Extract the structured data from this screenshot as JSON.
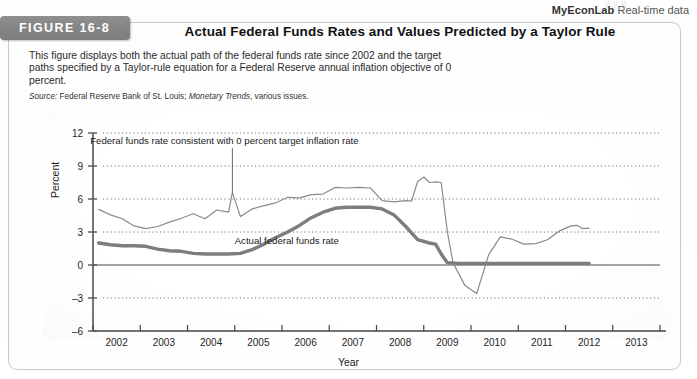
{
  "header": {
    "brand_bold": "MyEconLab",
    "brand_rest": " Real-time data",
    "bleed_text": "y  y   g"
  },
  "figure": {
    "badge_label": "FIGURE 16-8",
    "title": "Actual Federal Funds Rates and Values Predicted by a Taylor Rule",
    "description": "This figure displays both the actual path of the federal funds rate since 2002 and the target paths specified by a Taylor-rule equation for a Federal Reserve annual inflation objective of 0 percent.",
    "source_prefix": "Source:",
    "source_text": " Federal Reserve Bank of St. Louis; ",
    "source_italic": "Monetary Trends",
    "source_suffix": ", various issues."
  },
  "chart_data": {
    "type": "line",
    "title": "Actual Federal Funds Rates and Values Predicted by a Taylor Rule",
    "xlabel": "Year",
    "ylabel": "Percent",
    "xlim": [
      2001.5,
      2013.5
    ],
    "ylim": [
      -6,
      12
    ],
    "yticks": [
      12,
      9,
      6,
      3,
      0,
      -3,
      -6
    ],
    "xticks": [
      2002,
      2003,
      2004,
      2005,
      2006,
      2007,
      2008,
      2009,
      2010,
      2011,
      2012,
      2013
    ],
    "grid": "horizontal-dotted",
    "legend": "annotations",
    "annotations": [
      {
        "text": "Federal funds rate consistent with 0 percent target inflation rate",
        "target_x": 2004.45,
        "target_y": 6.6
      },
      {
        "text": "Actual federal funds rate",
        "target_x": 2005.6,
        "target_y": 2.2
      }
    ],
    "series": [
      {
        "name": "Federal funds rate consistent with 0 percent target inflation rate",
        "style": "thin",
        "color": "#8a8a8a",
        "width": 1.2,
        "points": [
          [
            2001.62,
            5.05
          ],
          [
            2001.87,
            4.55
          ],
          [
            2002.12,
            4.2
          ],
          [
            2002.37,
            3.55
          ],
          [
            2002.62,
            3.3
          ],
          [
            2002.87,
            3.5
          ],
          [
            2003.12,
            3.9
          ],
          [
            2003.37,
            4.25
          ],
          [
            2003.62,
            4.65
          ],
          [
            2003.87,
            4.2
          ],
          [
            2004.12,
            5.0
          ],
          [
            2004.37,
            4.8
          ],
          [
            2004.45,
            6.6
          ],
          [
            2004.62,
            4.4
          ],
          [
            2004.87,
            5.1
          ],
          [
            2005.12,
            5.4
          ],
          [
            2005.37,
            5.65
          ],
          [
            2005.62,
            6.15
          ],
          [
            2005.87,
            6.1
          ],
          [
            2006.12,
            6.4
          ],
          [
            2006.37,
            6.45
          ],
          [
            2006.62,
            7.05
          ],
          [
            2006.87,
            7.0
          ],
          [
            2007.12,
            7.05
          ],
          [
            2007.37,
            7.0
          ],
          [
            2007.62,
            5.85
          ],
          [
            2007.87,
            5.75
          ],
          [
            2008.12,
            5.85
          ],
          [
            2008.24,
            5.8
          ],
          [
            2008.37,
            7.6
          ],
          [
            2008.5,
            8.0
          ],
          [
            2008.62,
            7.5
          ],
          [
            2008.75,
            7.55
          ],
          [
            2008.87,
            7.5
          ],
          [
            2009.0,
            3.0
          ],
          [
            2009.12,
            0.2
          ],
          [
            2009.37,
            -1.85
          ],
          [
            2009.62,
            -2.6
          ],
          [
            2009.87,
            0.9
          ],
          [
            2010.12,
            2.55
          ],
          [
            2010.37,
            2.35
          ],
          [
            2010.62,
            1.9
          ],
          [
            2010.87,
            1.95
          ],
          [
            2011.12,
            2.3
          ],
          [
            2011.37,
            3.1
          ],
          [
            2011.62,
            3.55
          ],
          [
            2011.75,
            3.6
          ],
          [
            2011.87,
            3.3
          ],
          [
            2012.0,
            3.35
          ]
        ]
      },
      {
        "name": "Actual federal funds rate",
        "style": "thick",
        "color": "#7d7d7d",
        "width": 3.4,
        "points": [
          [
            2001.62,
            2.0
          ],
          [
            2001.87,
            1.85
          ],
          [
            2002.12,
            1.75
          ],
          [
            2002.37,
            1.75
          ],
          [
            2002.62,
            1.7
          ],
          [
            2002.87,
            1.45
          ],
          [
            2003.12,
            1.3
          ],
          [
            2003.37,
            1.25
          ],
          [
            2003.62,
            1.05
          ],
          [
            2003.87,
            1.0
          ],
          [
            2004.12,
            1.0
          ],
          [
            2004.37,
            1.0
          ],
          [
            2004.62,
            1.05
          ],
          [
            2004.87,
            1.4
          ],
          [
            2005.12,
            1.9
          ],
          [
            2005.37,
            2.5
          ],
          [
            2005.62,
            3.0
          ],
          [
            2005.87,
            3.6
          ],
          [
            2006.12,
            4.3
          ],
          [
            2006.37,
            4.8
          ],
          [
            2006.62,
            5.15
          ],
          [
            2006.87,
            5.25
          ],
          [
            2007.12,
            5.25
          ],
          [
            2007.37,
            5.25
          ],
          [
            2007.62,
            5.1
          ],
          [
            2007.87,
            4.55
          ],
          [
            2008.12,
            3.5
          ],
          [
            2008.37,
            2.3
          ],
          [
            2008.62,
            2.0
          ],
          [
            2008.75,
            1.9
          ],
          [
            2008.87,
            1.0
          ],
          [
            2009.0,
            0.2
          ],
          [
            2009.25,
            0.15
          ],
          [
            2009.5,
            0.15
          ],
          [
            2010.0,
            0.15
          ],
          [
            2010.5,
            0.15
          ],
          [
            2011.0,
            0.15
          ],
          [
            2011.5,
            0.15
          ],
          [
            2012.0,
            0.15
          ]
        ]
      }
    ]
  }
}
